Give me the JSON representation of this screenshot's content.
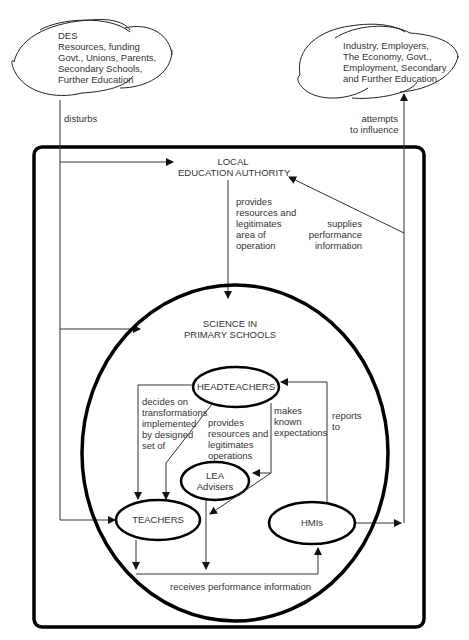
{
  "clouds": {
    "left": {
      "lines": [
        "DES",
        "Resources, funding",
        "Govt., Unions, Parents,",
        "Secondary Schools,",
        "Further Education"
      ]
    },
    "right": {
      "lines": [
        "Industry, Employers,",
        "The Economy, Govt.,",
        "Employment, Secondary",
        "and Further Education"
      ]
    }
  },
  "edges": {
    "disturbs": "disturbs",
    "attempts": [
      "attempts",
      "to influence"
    ],
    "lea_provides": [
      "provides",
      "resources and",
      "legitimates",
      "area of",
      "operation"
    ],
    "supplies": [
      "supplies",
      "performance",
      "information"
    ],
    "decides": [
      "decides on",
      "transformations",
      "implemented",
      "by designed",
      "set of"
    ],
    "head_provides": [
      "provides",
      "resources and",
      "legitimates",
      "operations"
    ],
    "makes_known": [
      "makes",
      "known",
      "expectations"
    ],
    "reports_to": [
      "reports",
      "to"
    ],
    "receives": "receives performance information"
  },
  "nodes": {
    "lea": [
      "LOCAL",
      "EDUCATION AUTHORITY"
    ],
    "science": [
      "SCIENCE IN",
      "PRIMARY SCHOOLS"
    ],
    "headteachers": "HEADTEACHERS",
    "lea_advisers": [
      "LEA",
      "Advisers"
    ],
    "teachers": "TEACHERS",
    "hmis": "HMIs"
  }
}
